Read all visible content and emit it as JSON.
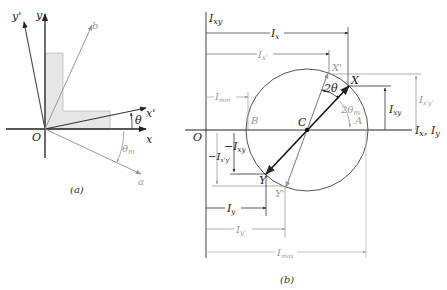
{
  "panel_a": {
    "caption": "(a)",
    "origin_label": "O",
    "axes": {
      "x": "x",
      "y": "y",
      "x_prime": "x'",
      "y_prime": "y'",
      "a": "a",
      "b": "b"
    },
    "angles": {
      "theta": "θ",
      "theta_m": "θ",
      "theta_m_sub": "m"
    },
    "colors": {
      "shape_fill": "#e6e6e6",
      "axis": "#222222",
      "gray_axis": "#999999"
    }
  },
  "panel_b": {
    "caption": "(b)",
    "origin_label": "O",
    "vertical_axis": {
      "main": "I",
      "sub": "xy"
    },
    "horizontal_axis": {
      "main1": "I",
      "sub1": "x",
      "sep": ", ",
      "main2": "I",
      "sub2": "y"
    },
    "points": {
      "C": "C",
      "X": "X",
      "X_prime": "X'",
      "Y": "Y",
      "Y_prime": "Y'",
      "A": "A",
      "B": "B"
    },
    "angles": {
      "two_theta": "2θ",
      "two_theta_m": "2θ",
      "two_theta_m_sub": "m"
    },
    "dimensions": {
      "Ix": {
        "main": "I",
        "sub": "x"
      },
      "Ix_prime": {
        "main": "I",
        "sub": "x'"
      },
      "Imin": {
        "main": "I",
        "sub": "min"
      },
      "Ixy": {
        "main": "I",
        "sub": "xy"
      },
      "Ixpyp": {
        "main": "I",
        "sub": "x'y'"
      },
      "neg_Ixy": {
        "main": "−I",
        "sub": "xy"
      },
      "neg_Ixpyp": {
        "main": "−I",
        "sub": "x'y'"
      },
      "Iy": {
        "main": "I",
        "sub": "y"
      },
      "Iy_prime": {
        "main": "I",
        "sub": "y'"
      },
      "Imax": {
        "main": "I",
        "sub": "max"
      }
    },
    "colors": {
      "circle": "#555555",
      "gray": "#9a9a9a",
      "dark": "#111111"
    }
  }
}
